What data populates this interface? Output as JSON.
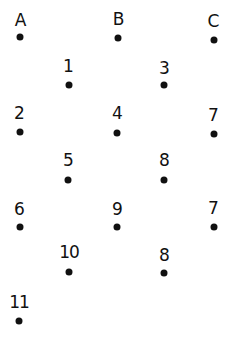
{
  "points": [
    {
      "label": "A",
      "lx": 20,
      "ly": 20,
      "dx": 20,
      "dy": 37
    },
    {
      "label": "B",
      "lx": 118,
      "ly": 19,
      "dx": 118,
      "dy": 38
    },
    {
      "label": "C",
      "lx": 213,
      "ly": 21,
      "dx": 214,
      "dy": 40
    },
    {
      "label": "1",
      "lx": 68,
      "ly": 66,
      "dx": 69,
      "dy": 85
    },
    {
      "label": "3",
      "lx": 164,
      "ly": 68,
      "dx": 164,
      "dy": 85
    },
    {
      "label": "2",
      "lx": 19,
      "ly": 113,
      "dx": 20,
      "dy": 132
    },
    {
      "label": "4",
      "lx": 117,
      "ly": 113,
      "dx": 117,
      "dy": 133
    },
    {
      "label": "7",
      "lx": 213,
      "ly": 115,
      "dx": 214,
      "dy": 134
    },
    {
      "label": "5",
      "lx": 68,
      "ly": 160,
      "dx": 68,
      "dy": 180
    },
    {
      "label": "8",
      "lx": 164,
      "ly": 160,
      "dx": 164,
      "dy": 180
    },
    {
      "label": "6",
      "lx": 19,
      "ly": 209,
      "dx": 20,
      "dy": 227
    },
    {
      "label": "9",
      "lx": 117,
      "ly": 209,
      "dx": 117,
      "dy": 227
    },
    {
      "label": "7",
      "lx": 213,
      "ly": 208,
      "dx": 214,
      "dy": 227
    },
    {
      "label": "10",
      "lx": 69,
      "ly": 252,
      "dx": 69,
      "dy": 272
    },
    {
      "label": "8",
      "lx": 164,
      "ly": 255,
      "dx": 164,
      "dy": 273
    },
    {
      "label": "11",
      "lx": 19,
      "ly": 302,
      "dx": 19,
      "dy": 321
    }
  ]
}
